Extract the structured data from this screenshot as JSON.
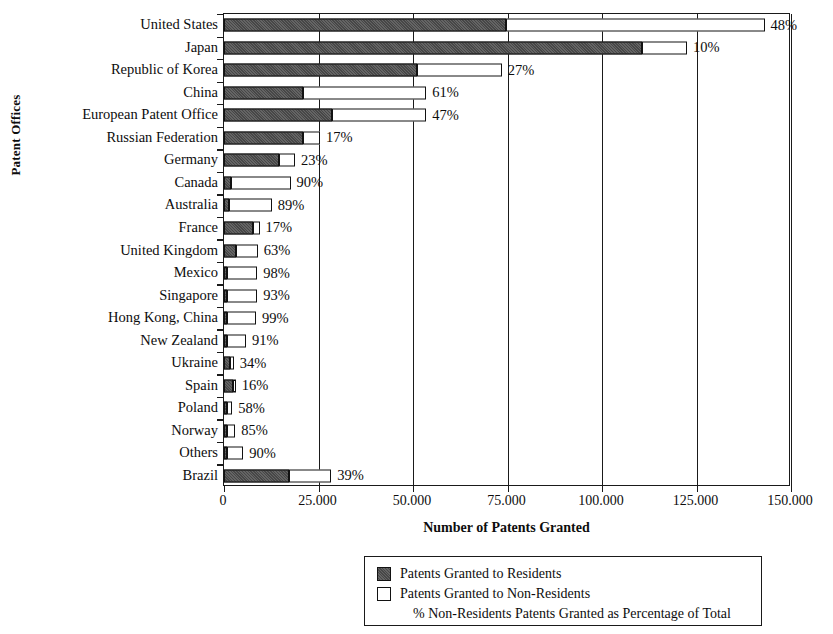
{
  "chart_data": {
    "type": "bar",
    "orientation": "horizontal",
    "stacked": true,
    "title": "",
    "xlabel": "Number of Patents Granted",
    "ylabel": "Patent Offices",
    "xlim": [
      0,
      150000
    ],
    "xticks": [
      0,
      25000,
      50000,
      75000,
      100000,
      125000,
      150000
    ],
    "xticklabels": [
      "0",
      "25.000",
      "50.000",
      "75.000",
      "100.000",
      "125.000",
      "150.000"
    ],
    "grid": "vertical",
    "legend_position": "bottom",
    "categories": [
      "United States",
      "Japan",
      "Republic of Korea",
      "China",
      "European Patent Office",
      "Russian Federation",
      "Germany",
      "Canada",
      "Australia",
      "France",
      "United Kingdom",
      "Mexico",
      "Singapore",
      "Hong Kong, China",
      "New Zealand",
      "Ukraine",
      "Spain",
      "Poland",
      "Norway",
      "Others",
      "Brazil"
    ],
    "series": [
      {
        "name": "Patents Granted to Residents",
        "color": "#474747",
        "values": [
          74500,
          110500,
          51000,
          21000,
          28500,
          21000,
          14500,
          1800,
          1400,
          7800,
          3300,
          200,
          600,
          200,
          400,
          1700,
          2300,
          900,
          400,
          500,
          17300
        ]
      },
      {
        "name": "Patents Granted to Non-Residents",
        "color": "#ffffff",
        "values": [
          68500,
          12000,
          22500,
          32500,
          25000,
          4400,
          4300,
          15800,
          11200,
          1600,
          5600,
          8000,
          8000,
          7700,
          5000,
          900,
          450,
          1300,
          2200,
          4300,
          11100
        ]
      }
    ],
    "totals": [
      143000,
      122500,
      73500,
      53500,
      53500,
      25400,
      18800,
      17600,
      12600,
      9400,
      8900,
      8200,
      8600,
      7900,
      5400,
      2600,
      2750,
      2200,
      2600,
      4800,
      28400
    ],
    "data_labels": [
      "48%",
      "10%",
      "27%",
      "61%",
      "47%",
      "17%",
      "23%",
      "90%",
      "89%",
      "17%",
      "63%",
      "98%",
      "93%",
      "99%",
      "91%",
      "34%",
      "16%",
      "58%",
      "85%",
      "90%",
      "39%"
    ],
    "data_label_meaning": "% Non-Residents Patents Granted as Percentage of Total",
    "legend_entries": [
      "Patents Granted to Residents",
      "Patents Granted to Non-Residents"
    ],
    "legend_note": "% Non-Residents Patents Granted as Percentage of Total"
  }
}
